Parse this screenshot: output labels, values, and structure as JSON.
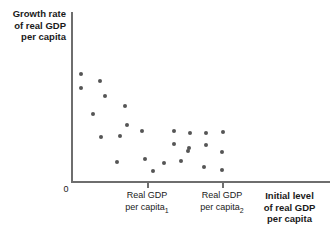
{
  "chart_data": {
    "type": "scatter",
    "title": "",
    "xlabel": "Initial level of real GDP per capita",
    "ylabel": "Growth rate of real GDP per capita",
    "grid": false,
    "legend": null,
    "xlim": [
      0,
      1
    ],
    "ylim": [
      0,
      1
    ],
    "x_tick_labels": [
      "Real GDP per capita₁",
      "Real GDP per capita₂"
    ],
    "x_tick_positions_px": [
      147,
      222
    ],
    "origin_label": "0",
    "point_color": "#555555",
    "axis_color": "#6e6e6e",
    "points_px": [
      {
        "x": 81,
        "y": 74
      },
      {
        "x": 81,
        "y": 88
      },
      {
        "x": 100,
        "y": 81
      },
      {
        "x": 105,
        "y": 96
      },
      {
        "x": 93,
        "y": 114
      },
      {
        "x": 125,
        "y": 106
      },
      {
        "x": 127,
        "y": 125
      },
      {
        "x": 101,
        "y": 137
      },
      {
        "x": 120,
        "y": 136
      },
      {
        "x": 142,
        "y": 131
      },
      {
        "x": 117,
        "y": 162
      },
      {
        "x": 145,
        "y": 159
      },
      {
        "x": 153,
        "y": 171
      },
      {
        "x": 164,
        "y": 163
      },
      {
        "x": 174,
        "y": 131
      },
      {
        "x": 174,
        "y": 144
      },
      {
        "x": 181,
        "y": 161
      },
      {
        "x": 188,
        "y": 151
      },
      {
        "x": 190,
        "y": 133
      },
      {
        "x": 189,
        "y": 148
      },
      {
        "x": 204,
        "y": 167
      },
      {
        "x": 206,
        "y": 133
      },
      {
        "x": 206,
        "y": 145
      },
      {
        "x": 223,
        "y": 132
      },
      {
        "x": 222,
        "y": 152
      },
      {
        "x": 222,
        "y": 170
      }
    ]
  },
  "axis": {
    "y_title_lines": [
      "Growth rate",
      "of real GDP",
      "per capita"
    ],
    "x_title_lines": [
      "Initial level",
      "of real GDP",
      "per capita"
    ],
    "origin": "0",
    "tick_labels": [
      {
        "line1": "Real GDP",
        "line2": "per capita",
        "subscript": "1"
      },
      {
        "line1": "Real GDP",
        "line2": "per capita",
        "subscript": "2"
      }
    ]
  }
}
